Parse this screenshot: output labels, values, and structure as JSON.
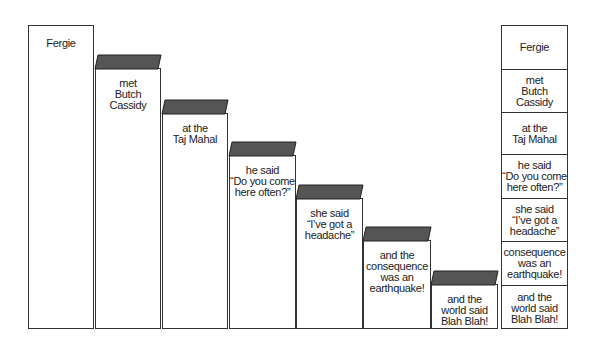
{
  "diagram": {
    "roof_color": "#555555",
    "stair_columns": [
      {
        "label": "Fergie",
        "x": 28,
        "w": 66,
        "top": 25,
        "roof": false
      },
      {
        "label": "met\nButch Cassidy",
        "x": 95,
        "w": 66,
        "top": 54,
        "roof": true
      },
      {
        "label": "at the\nTaj Mahal",
        "x": 162,
        "w": 66,
        "top": 99,
        "roof": true
      },
      {
        "label": "he said\n“Do you come\nhere often?”",
        "x": 229,
        "w": 67,
        "top": 141,
        "roof": true
      },
      {
        "label": "she said\n“I’ve got a\nheadache”",
        "x": 296,
        "w": 67,
        "top": 184,
        "roof": true
      },
      {
        "label": "and the\nconsequence\nwas an\nearthquake!",
        "x": 363,
        "w": 68,
        "top": 226,
        "roof": true
      },
      {
        "label": "and the\nworld said\nBlah Blah!",
        "x": 431,
        "w": 67,
        "top": 270,
        "roof": true
      }
    ],
    "stack_column": {
      "x": 501,
      "w": 67,
      "top": 25,
      "bottom": 329,
      "cells": [
        {
          "label": "Fergie",
          "top": 25,
          "bottom": 68
        },
        {
          "label": "met\nButch Cassidy",
          "top": 68,
          "bottom": 111
        },
        {
          "label": "at the\nTaj Mahal",
          "top": 111,
          "bottom": 153
        },
        {
          "label": "he said\n“Do you come\nhere often?”",
          "top": 153,
          "bottom": 197
        },
        {
          "label": "she said\n“I’ve got a\nheadache”",
          "top": 197,
          "bottom": 240
        },
        {
          "label": "consequence\nwas an\nearthquake!",
          "top": 240,
          "bottom": 284
        },
        {
          "label": "and the\nworld said\nBlah Blah!",
          "top": 284,
          "bottom": 329
        }
      ]
    },
    "bottom": 329
  }
}
